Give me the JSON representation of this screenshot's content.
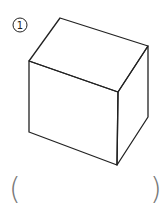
{
  "figure": {
    "item_number": "1",
    "item_marker": "circled-number",
    "shape": "rectangular-box",
    "stroke_color": "#222222",
    "answer_blank": {
      "open": "(",
      "close": ")",
      "value": ""
    }
  }
}
